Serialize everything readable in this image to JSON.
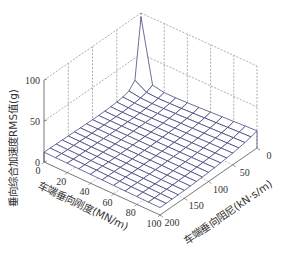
{
  "chart_data": {
    "type": "surface3d",
    "title": "",
    "xlabel": "车端垂向刚度(MN/m)",
    "ylabel": "车端垂向阻尼(kN·s/m)",
    "zlabel": "垂向综合加速度RMS值(g)",
    "x_ticks": [
      0,
      20,
      40,
      60,
      80,
      100
    ],
    "y_ticks": [
      0,
      50,
      100,
      150,
      200
    ],
    "z_ticks": [
      0,
      50,
      100
    ],
    "xlim": [
      0,
      100
    ],
    "ylim": [
      0,
      200
    ],
    "zlim": [
      0,
      100
    ],
    "grid": true,
    "surface_color": "#3a3f7a",
    "x": [
      0,
      10,
      20,
      30,
      40,
      50,
      60,
      70,
      80,
      90,
      100
    ],
    "y": [
      0,
      12.5,
      25,
      37.5,
      50,
      62.5,
      75,
      87.5,
      100,
      112.5,
      125,
      137.5,
      150,
      162.5,
      175,
      187.5,
      200
    ],
    "z_description": "RMS value peaks at ~80 g at stiffness 0 / damping 0, drops steeply to ~25 g within first grid cells, and is roughly flat at 8–15 g elsewhere, slightly rising toward high stiffness with low damping (~17 g).",
    "peak": {
      "x": 0,
      "y": 0,
      "z": 80
    },
    "corner_values": {
      "x0_y200": 12,
      "x100_y200": 9,
      "x100_y0": 17
    }
  },
  "axes": {
    "z_label": "垂向综合加速度RMS值(g)",
    "x_label": "车端垂向刚度(MN/m)",
    "y_label": "车端垂向阻尼(kN·s/m)",
    "z_ticks": [
      "0",
      "50",
      "100"
    ],
    "x_ticks": [
      "0",
      "20",
      "40",
      "60",
      "80",
      "100"
    ],
    "y_ticks": [
      "0",
      "50",
      "100",
      "150",
      "200"
    ]
  }
}
